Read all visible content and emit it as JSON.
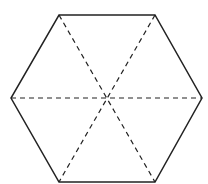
{
  "diagram": {
    "shape": "regular-hexagon",
    "stroke_color": "#222222",
    "background": "#ffffff",
    "vertices": [
      [
        59,
        15
      ],
      [
        155,
        15
      ],
      [
        202,
        98
      ],
      [
        155,
        182
      ],
      [
        59,
        182
      ],
      [
        11,
        98
      ]
    ],
    "center": [
      106,
      98
    ],
    "diagonals": [
      {
        "from": 0,
        "to": 3,
        "style": "dashed"
      },
      {
        "from": 1,
        "to": 4,
        "style": "dashed"
      },
      {
        "from": 5,
        "to": 2,
        "style": "dashed"
      }
    ]
  }
}
